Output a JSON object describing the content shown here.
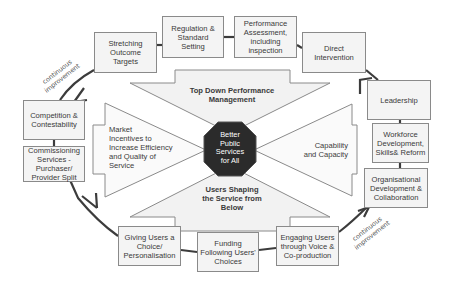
{
  "center": {
    "label": "Better Public Services for All",
    "lines": [
      "Better",
      "Public",
      "Services",
      "for All"
    ],
    "color": "#2b2b2b"
  },
  "arrows": {
    "top": {
      "lines": [
        "Top Down Performance",
        "Management"
      ]
    },
    "bottom": {
      "lines": [
        "Users Shaping",
        "the Service from",
        "Below"
      ]
    },
    "left": {
      "lines": [
        "Market",
        "Incentives to",
        "Increase Efficiency",
        "and Quality of",
        "Service"
      ]
    },
    "right": {
      "lines": [
        "Capability",
        "and Capacity"
      ]
    }
  },
  "boxes": {
    "stretching": "Stretching Outcome Targets",
    "regulation": "Regulation & Standard Setting",
    "performance": "Performance Assessment, including inspection",
    "direct": "Direct Intervention",
    "leadership": "Leadership",
    "workforce": "Workforce Development, Skills& Reform",
    "organisational": "Organisational Development & Collaboration",
    "competition": "Competition & Contestability",
    "commissioning": "Commissioning Services - Purchaser/ Provider Split",
    "giving": "Giving Users a Choice/ Personalisation",
    "funding": "Funding Following Users' Choices",
    "engaging": "Engaging Users through Voice & Co-production"
  },
  "cycle_labels": {
    "top_left": [
      "continuous",
      "improvement"
    ],
    "bottom_right": [
      "continuous",
      "improvement"
    ]
  },
  "colors": {
    "box_border": "#8a8a8a",
    "box_fill": "#f4f4f4",
    "cycle_line": "#3c3c3c",
    "text": "#3a3a3a"
  }
}
